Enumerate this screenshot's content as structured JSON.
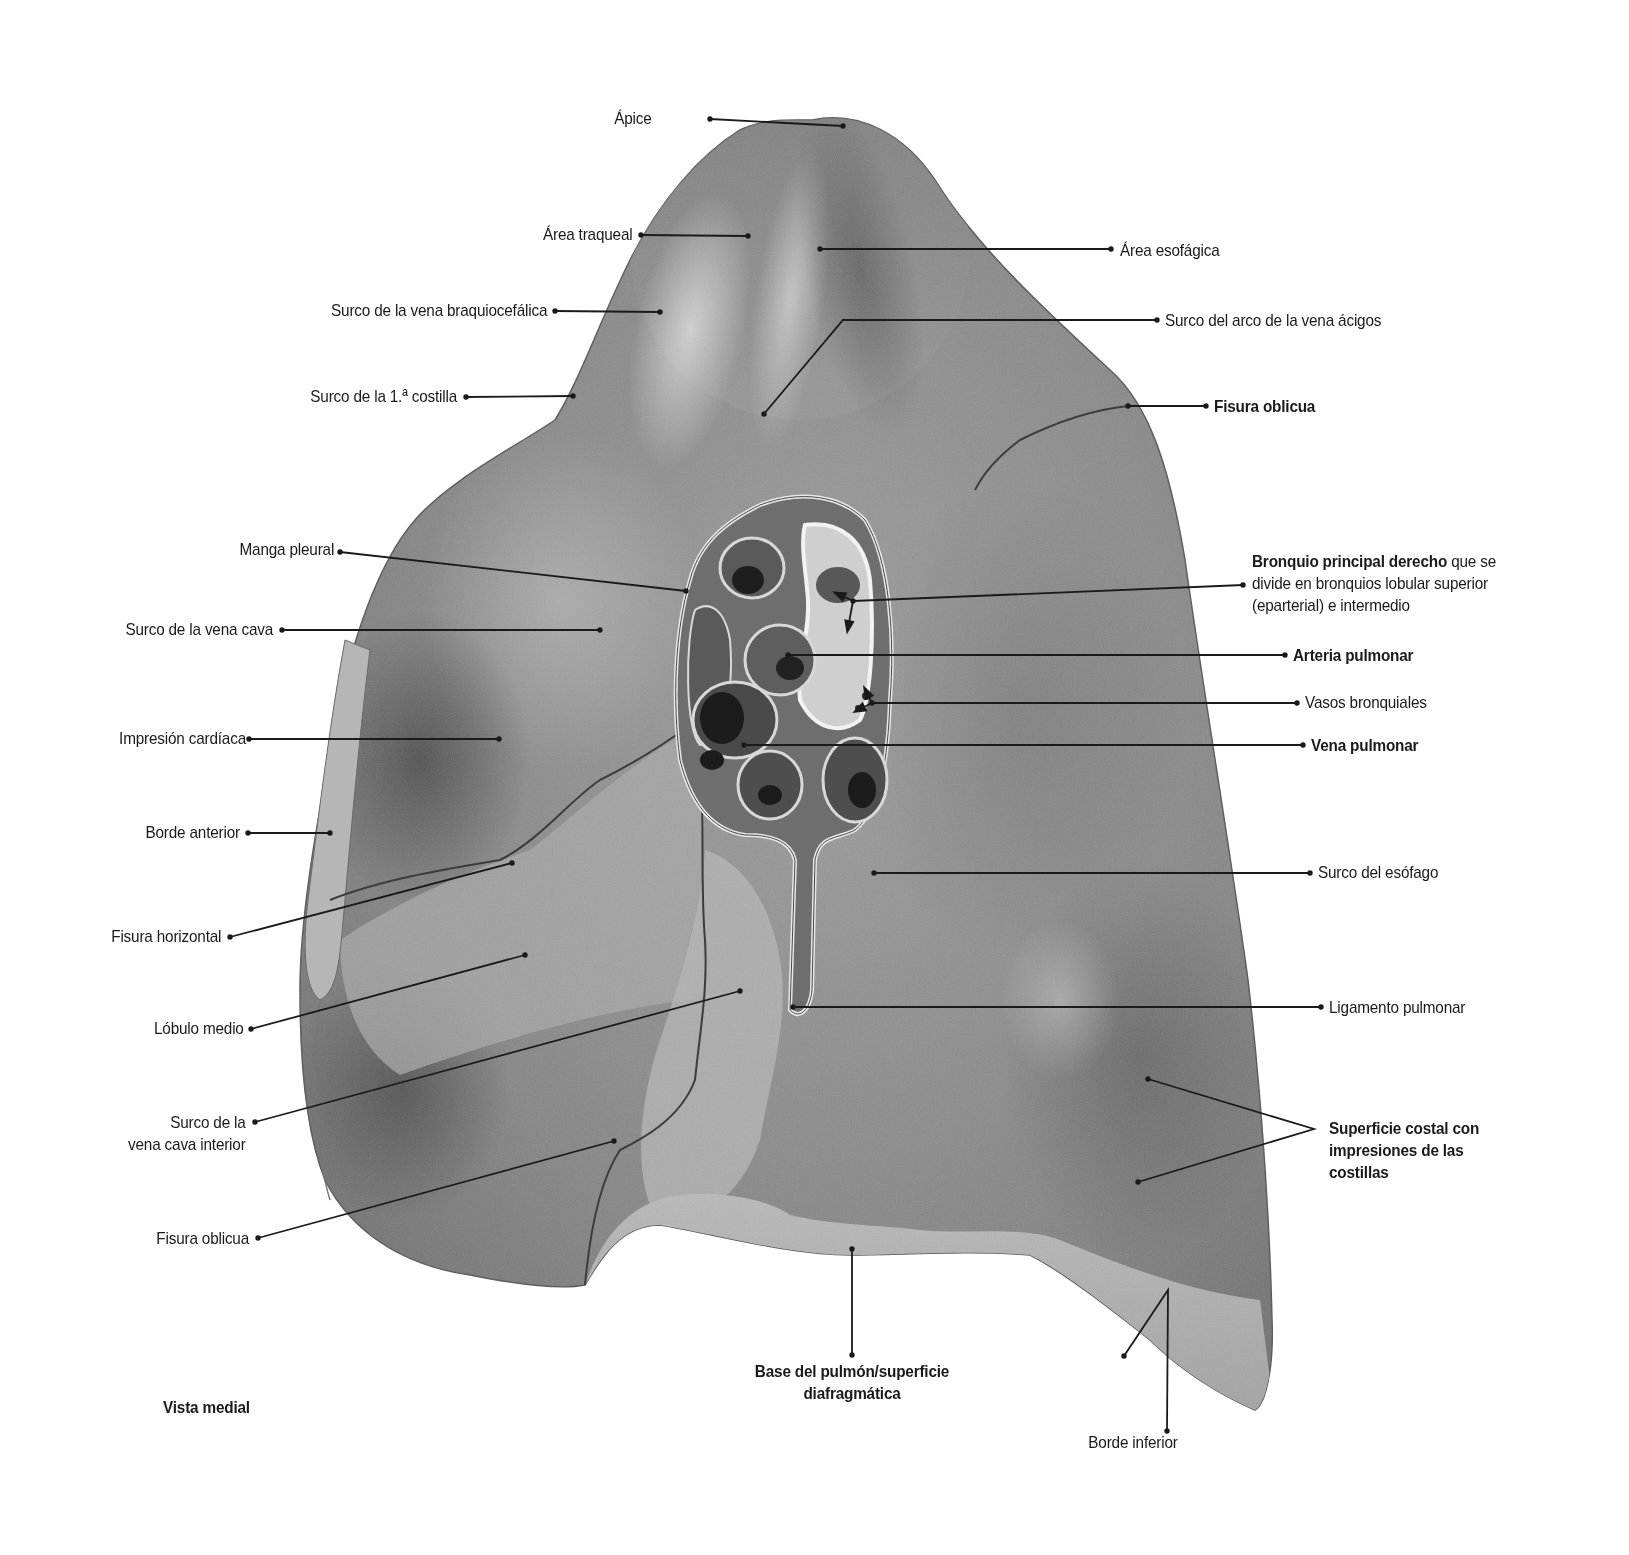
{
  "figure": {
    "view_caption": "Vista medial"
  },
  "colors": {
    "background": "#ffffff",
    "lung_base": "#8e8e8e",
    "lung_dark": "#4a4a4a",
    "lung_light": "#bdbdbd",
    "leader_line": "#1a1a1a",
    "text": "#1a1a1a"
  },
  "labels_left": [
    {
      "id": "apice",
      "text": "Ápice",
      "bold": false,
      "x": 652,
      "y": 108,
      "anchor": "end",
      "line": [
        [
          710,
          119
        ],
        [
          843,
          126
        ]
      ]
    },
    {
      "id": "area-traqueal",
      "text": "Área traqueal",
      "bold": false,
      "x": 632,
      "y": 224,
      "anchor": "end",
      "line": [
        [
          641,
          235
        ],
        [
          748,
          236
        ]
      ]
    },
    {
      "id": "surco-vena-braquiocefalica",
      "text": "Surco de la vena braquiocefálica",
      "bold": false,
      "x": 547,
      "y": 300,
      "anchor": "end",
      "line": [
        [
          555,
          311
        ],
        [
          660,
          312
        ]
      ]
    },
    {
      "id": "surco-1a-costilla",
      "text": "Surco de la 1.ª costilla",
      "bold": false,
      "x": 457,
      "y": 386,
      "anchor": "end",
      "line": [
        [
          466,
          397
        ],
        [
          573,
          396
        ]
      ]
    },
    {
      "id": "manga-pleural",
      "text": "Manga pleural",
      "bold": false,
      "x": 334,
      "y": 539,
      "anchor": "end",
      "line": [
        [
          340,
          552
        ],
        [
          686,
          591
        ]
      ]
    },
    {
      "id": "surco-vena-cava",
      "text": "Surco de la vena cava",
      "bold": false,
      "x": 273,
      "y": 619,
      "anchor": "end",
      "line": [
        [
          282,
          630
        ],
        [
          600,
          630
        ]
      ]
    },
    {
      "id": "impresion-cardiaca",
      "text": "Impresión cardíaca",
      "bold": false,
      "x": 246,
      "y": 728,
      "anchor": "end",
      "line": [
        [
          249,
          739
        ],
        [
          499,
          739
        ]
      ]
    },
    {
      "id": "borde-anterior",
      "text": "Borde anterior",
      "bold": false,
      "x": 240,
      "y": 822,
      "anchor": "end",
      "line": [
        [
          248,
          833
        ],
        [
          330,
          833
        ]
      ]
    },
    {
      "id": "fisura-horizontal",
      "text": "Fisura horizontal",
      "bold": false,
      "x": 221,
      "y": 926,
      "anchor": "end",
      "line": [
        [
          230,
          937
        ],
        [
          512,
          863
        ]
      ]
    },
    {
      "id": "lobulo-medio",
      "text": "Lóbulo medio",
      "bold": false,
      "x": 244,
      "y": 1018,
      "anchor": "end",
      "line": [
        [
          251,
          1029
        ],
        [
          525,
          955
        ]
      ]
    },
    {
      "id": "surco-vena-cava-inferior",
      "text": "Surco de la\nvena cava interior",
      "bold": false,
      "x": 246,
      "y": 1112,
      "anchor": "end",
      "line": [
        [
          255,
          1122
        ],
        [
          740,
          991
        ]
      ]
    },
    {
      "id": "fisura-oblicua-izq",
      "text": "Fisura oblicua",
      "bold": false,
      "x": 249,
      "y": 1228,
      "anchor": "end",
      "line": [
        [
          258,
          1238
        ],
        [
          614,
          1141
        ]
      ]
    }
  ],
  "labels_right": [
    {
      "id": "area-esofagica",
      "text": "Área esofágica",
      "bold": false,
      "x": 1120,
      "y": 240,
      "anchor": "start",
      "line": [
        [
          820,
          249
        ],
        [
          1111,
          249
        ]
      ]
    },
    {
      "id": "surco-arco-vena-acigos",
      "text": "Surco del arco de la vena ácigos",
      "bold": false,
      "x": 1165,
      "y": 310,
      "anchor": "start",
      "line": [
        [
          764,
          414
        ],
        [
          843,
          320
        ],
        [
          1157,
          320
        ]
      ]
    },
    {
      "id": "fisura-oblicua-der",
      "text": "Fisura oblicua",
      "bold": true,
      "x": 1214,
      "y": 396,
      "anchor": "start",
      "line": [
        [
          1128,
          406
        ],
        [
          1206,
          406
        ]
      ]
    },
    {
      "id": "bronquio-principal",
      "text_bold": "Bronquio principal derecho",
      "text": " que se\ndivide en bronquios lobular superior\n(eparterial) e intermedio",
      "bold": false,
      "x": 1252,
      "y": 551,
      "anchor": "start",
      "line": [
        [
          853,
          601
        ],
        [
          1243,
          585
        ]
      ],
      "arrows": [
        [
          [
            853,
            601
          ],
          [
            838,
            594
          ]
        ],
        [
          [
            853,
            601
          ],
          [
            848,
            628
          ]
        ]
      ]
    },
    {
      "id": "arteria-pulmonar",
      "text": "Arteria pulmonar",
      "bold": true,
      "x": 1293,
      "y": 645,
      "anchor": "start",
      "line": [
        [
          788,
          655
        ],
        [
          1285,
          655
        ]
      ]
    },
    {
      "id": "vasos-bronquiales",
      "text": "Vasos bronquiales",
      "bold": false,
      "x": 1305,
      "y": 692,
      "anchor": "start",
      "line": [
        [
          872,
          703
        ],
        [
          1297,
          703
        ]
      ],
      "arrows": [
        [
          [
            872,
            703
          ],
          [
            866,
            691
          ]
        ],
        [
          [
            872,
            703
          ],
          [
            858,
            710
          ]
        ]
      ]
    },
    {
      "id": "vena-pulmonar",
      "text": "Vena pulmonar",
      "bold": true,
      "x": 1311,
      "y": 735,
      "anchor": "start",
      "line": [
        [
          744,
          745
        ],
        [
          1303,
          745
        ]
      ]
    },
    {
      "id": "surco-esofago",
      "text": "Surco del esófago",
      "bold": false,
      "x": 1318,
      "y": 862,
      "anchor": "start",
      "line": [
        [
          874,
          873
        ],
        [
          1310,
          873
        ]
      ]
    },
    {
      "id": "ligamento-pulmonar",
      "text": "Ligamento pulmonar",
      "bold": false,
      "x": 1329,
      "y": 997,
      "anchor": "start",
      "line": [
        [
          793,
          1007
        ],
        [
          1321,
          1007
        ]
      ]
    },
    {
      "id": "superficie-costal",
      "text": "Superficie costal con\nimpresiones de las\ncostillas",
      "bold": true,
      "x": 1329,
      "y": 1118,
      "anchor": "start",
      "line": [
        [
          1148,
          1079
        ],
        [
          1314,
          1129
        ],
        [
          1138,
          1182
        ]
      ]
    }
  ],
  "labels_bottom": [
    {
      "id": "base-pulmon",
      "text": "Base del pulmón/superficie\ndiafragmática",
      "bold": true,
      "x": 852,
      "y": 1361,
      "anchor": "middle",
      "line": [
        [
          852,
          1249
        ],
        [
          852,
          1355
        ]
      ]
    },
    {
      "id": "borde-inferior",
      "text": "Borde inferior",
      "bold": false,
      "x": 1133,
      "y": 1432,
      "anchor": "middle",
      "line": [
        [
          1124,
          1356
        ],
        [
          1168,
          1290
        ],
        [
          1167,
          1431
        ]
      ]
    }
  ]
}
